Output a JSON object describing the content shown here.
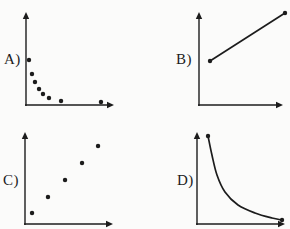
{
  "colors": {
    "ink": "#1c1c1c",
    "background": "#fbfbfa"
  },
  "chart_data": [
    {
      "id": "A",
      "label": "A)",
      "type": "scatter",
      "trend": "decreasing, steep drop then leveling off (inverse / exponential decay pattern)",
      "title": "",
      "xlabel": "",
      "ylabel": "",
      "axis_ticks": "none (unlabeled axes with arrowheads)",
      "points": [
        [
          0.034,
          0.484
        ],
        [
          0.068,
          0.333
        ],
        [
          0.102,
          0.247
        ],
        [
          0.148,
          0.172
        ],
        [
          0.193,
          0.118
        ],
        [
          0.261,
          0.075
        ],
        [
          0.398,
          0.043
        ],
        [
          0.852,
          0.032
        ]
      ]
    },
    {
      "id": "B",
      "label": "B)",
      "type": "line",
      "trend": "straight line increasing left to right, endpoints marked with dots",
      "title": "",
      "xlabel": "",
      "ylabel": "",
      "axis_ticks": "none (unlabeled axes with arrowheads)",
      "points": [
        [
          0.131,
          0.473
        ],
        [
          1.024,
          0.989
        ]
      ]
    },
    {
      "id": "C",
      "label": "C)",
      "type": "scatter",
      "trend": "increasing, roughly linear positive correlation",
      "title": "",
      "xlabel": "",
      "ylabel": "",
      "axis_ticks": "none (unlabeled axes with arrowheads)",
      "points": [
        [
          0.08,
          0.12
        ],
        [
          0.261,
          0.293
        ],
        [
          0.455,
          0.478
        ],
        [
          0.648,
          0.663
        ],
        [
          0.83,
          0.848
        ]
      ]
    },
    {
      "id": "D",
      "label": "D)",
      "type": "curve",
      "trend": "smooth hyperbolic decreasing curve hugging both axes, endpoints marked with dots",
      "title": "",
      "xlabel": "",
      "ylabel": "",
      "axis_ticks": "none (unlabeled axes with arrowheads)",
      "points": [
        [
          0.125,
          0.957
        ],
        [
          0.17,
          0.75
        ],
        [
          0.227,
          0.533
        ],
        [
          0.318,
          0.348
        ],
        [
          0.466,
          0.207
        ],
        [
          0.659,
          0.12
        ],
        [
          0.852,
          0.065
        ],
        [
          0.966,
          0.043
        ]
      ]
    }
  ]
}
